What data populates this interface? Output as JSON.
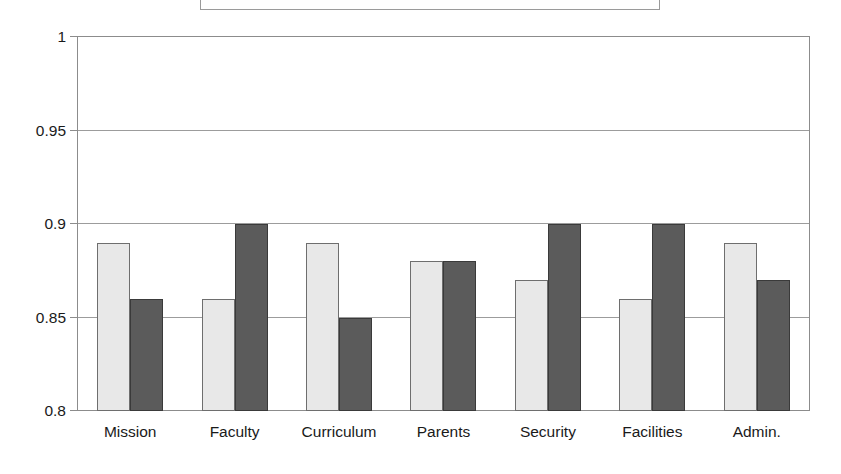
{
  "chart_data": {
    "type": "bar",
    "title": "",
    "subtitle": "",
    "xlabel": "",
    "ylabel": "",
    "categories": [
      "Mission",
      "Faculty",
      "Curriculum",
      "Parents",
      "Security",
      "Facilities",
      "Admin."
    ],
    "series": [
      {
        "name": "Series 1",
        "color": "#e8e8e8",
        "values": [
          0.89,
          0.86,
          0.89,
          0.88,
          0.87,
          0.86,
          0.89
        ]
      },
      {
        "name": "Series 2",
        "color": "#5b5b5b",
        "values": [
          0.86,
          0.9,
          0.85,
          0.88,
          0.9,
          0.9,
          0.87
        ]
      }
    ],
    "ylim": [
      0.8,
      1.0
    ],
    "ytick_labels": [
      "1",
      "0.95",
      "0.9",
      "0.85",
      "0.8"
    ],
    "ytick_values": [
      1,
      0.95,
      0.9,
      0.85,
      0.8
    ],
    "grid": true,
    "grid_axis": "y",
    "legend_position": "top",
    "legend_entries": [],
    "annotations": []
  },
  "legend": {
    "present": true,
    "cropped": true,
    "text": ""
  },
  "colors": {
    "series_light": "#e8e8e8",
    "series_dark": "#5b5b5b",
    "gridline": "#9c9c9c",
    "axis": "#8c8c8c",
    "text": "#1a1a1a",
    "background": "#ffffff"
  }
}
